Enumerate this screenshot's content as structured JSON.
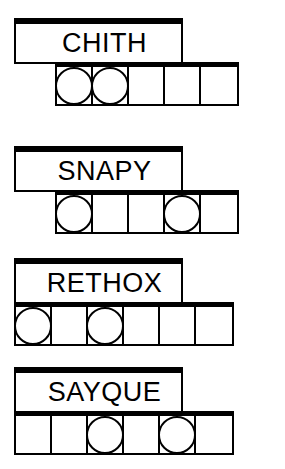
{
  "puzzle": {
    "title": "word-shape-puzzle",
    "ink_color": "#000000",
    "paper_color": "#ffffff",
    "cell_size_px": 36,
    "rows": [
      {
        "word": "CHITH",
        "word_box": {
          "x": 14,
          "y": 18,
          "width": 169,
          "height": 46
        },
        "grid": {
          "x": 55,
          "y": 62,
          "cells": 5,
          "cell_width": 36,
          "cell_height": 44
        },
        "circled_cells": [
          1,
          2
        ]
      },
      {
        "word": "SNAPY",
        "word_box": {
          "x": 14,
          "y": 146,
          "width": 169,
          "height": 46
        },
        "grid": {
          "x": 55,
          "y": 190,
          "cells": 5,
          "cell_width": 36,
          "cell_height": 44
        },
        "circled_cells": [
          1,
          4
        ]
      },
      {
        "word": "RETHOX",
        "word_box": {
          "x": 14,
          "y": 258,
          "width": 169,
          "height": 46
        },
        "grid": {
          "x": 14,
          "y": 302,
          "cells": 6,
          "cell_width": 36,
          "cell_height": 44
        },
        "circled_cells": [
          1,
          3
        ]
      },
      {
        "word": "SAYQUE",
        "word_box": {
          "x": 14,
          "y": 367,
          "width": 169,
          "height": 46
        },
        "grid": {
          "x": 14,
          "y": 411,
          "cells": 6,
          "cell_width": 36,
          "cell_height": 44
        },
        "circled_cells": [
          3,
          5
        ]
      }
    ]
  }
}
